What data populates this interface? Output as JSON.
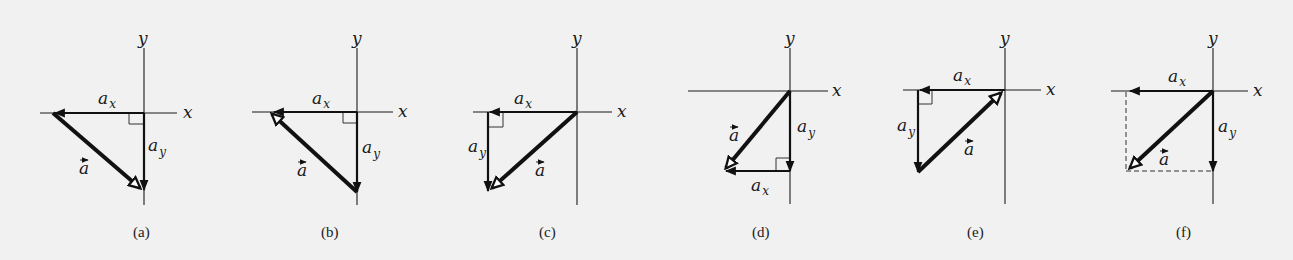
{
  "figure": {
    "background": "#f1f1f1",
    "ink": "#111111",
    "panels": [
      {
        "id": "a",
        "caption": "(a)",
        "origin": [
          144,
          113
        ],
        "x_axis": [
          40,
          177
        ],
        "y_axis": [
          48,
          205
        ],
        "x_label": "x",
        "y_label": "y",
        "ax": {
          "from": [
            144,
            113
          ],
          "to": [
            53,
            113
          ],
          "label": "a",
          "sub": "x"
        },
        "ay": {
          "from": [
            144,
            113
          ],
          "to": [
            144,
            190
          ],
          "label": "a",
          "sub": "y"
        },
        "a": {
          "from": [
            53,
            113
          ],
          "to": [
            142,
            190
          ],
          "label": "a"
        },
        "right_angle": "upper-left-of-origin"
      },
      {
        "id": "b",
        "caption": "(b)",
        "origin": [
          357,
          112
        ],
        "x_axis": [
          252,
          393
        ],
        "y_axis": [
          48,
          205
        ],
        "x_label": "x",
        "y_label": "y",
        "ax": {
          "from": [
            357,
            112
          ],
          "to": [
            270,
            112
          ],
          "label": "a",
          "sub": "x"
        },
        "ay": {
          "from": [
            357,
            112
          ],
          "to": [
            357,
            192
          ],
          "label": "a",
          "sub": "y"
        },
        "a": {
          "from": [
            357,
            192
          ],
          "to": [
            270,
            112
          ],
          "label": "a"
        },
        "right_angle": "at-origin"
      },
      {
        "id": "c",
        "caption": "(c)",
        "origin": [
          577,
          112
        ],
        "x_axis": [
          473,
          612
        ],
        "y_axis": [
          48,
          205
        ],
        "x_label": "x",
        "y_label": "y",
        "ax": {
          "from": [
            577,
            112
          ],
          "to": [
            488,
            112
          ],
          "label": "a",
          "sub": "x"
        },
        "ay": {
          "from": [
            488,
            112
          ],
          "to": [
            488,
            190
          ],
          "label": "a",
          "sub": "y"
        },
        "a": {
          "from": [
            577,
            112
          ],
          "to": [
            490,
            190
          ],
          "label": "a"
        },
        "right_angle": "at-ax-tip"
      },
      {
        "id": "d",
        "caption": "(d)",
        "origin": [
          790,
          91
        ],
        "x_axis": [
          688,
          828
        ],
        "y_axis": [
          48,
          204
        ],
        "x_label": "x",
        "y_label": "y",
        "ax": {
          "from": [
            790,
            171
          ],
          "to": [
            724,
            171
          ],
          "label": "a",
          "sub": "x"
        },
        "ay": {
          "from": [
            790,
            91
          ],
          "to": [
            790,
            171
          ],
          "label": "a",
          "sub": "y"
        },
        "a": {
          "from": [
            790,
            91
          ],
          "to": [
            724,
            171
          ],
          "label": "a"
        },
        "right_angle": "at-ay-tip"
      },
      {
        "id": "e",
        "caption": "(e)",
        "origin": [
          1005,
          90
        ],
        "x_axis": [
          903,
          1041
        ],
        "y_axis": [
          48,
          204
        ],
        "x_label": "x",
        "y_label": "y",
        "ax": {
          "from": [
            1005,
            90
          ],
          "to": [
            918,
            90
          ],
          "label": "a",
          "sub": "x"
        },
        "ay": {
          "from": [
            918,
            90
          ],
          "to": [
            918,
            172
          ],
          "label": "a",
          "sub": "y"
        },
        "a": {
          "from": [
            918,
            172
          ],
          "to": [
            1003,
            91
          ],
          "label": "a"
        },
        "right_angle": "at-ax-tip"
      },
      {
        "id": "f",
        "caption": "(f)",
        "origin": [
          1213,
          91
        ],
        "x_axis": [
          1111,
          1248
        ],
        "y_axis": [
          48,
          204
        ],
        "x_label": "x",
        "y_label": "y",
        "ax": {
          "from": [
            1213,
            91
          ],
          "to": [
            1126,
            91
          ],
          "label": "a",
          "sub": "x"
        },
        "ay": {
          "from": [
            1213,
            91
          ],
          "to": [
            1213,
            171
          ],
          "label": "a",
          "sub": "y"
        },
        "a": {
          "from": [
            1213,
            91
          ],
          "to": [
            1128,
            170
          ],
          "label": "a"
        },
        "dashed": [
          [
            [
              1126,
              91
            ],
            [
              1126,
              171
            ]
          ],
          [
            [
              1126,
              171
            ],
            [
              1213,
              171
            ]
          ]
        ],
        "right_angle": "none"
      }
    ]
  }
}
